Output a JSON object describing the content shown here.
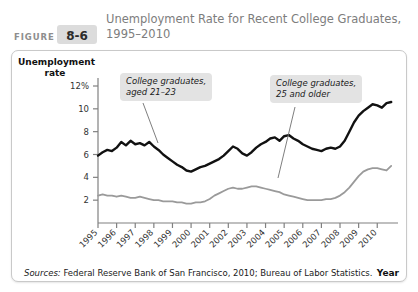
{
  "header": {
    "figure_word": "FIGURE",
    "figure_number": "8-6",
    "title": "Unemployment Rate for Recent College Graduates, 1995–2010"
  },
  "source_note": {
    "label": "Sources:",
    "text": " Federal Reserve Bank of San Francisco, 2010; Bureau of Labor Statistics."
  },
  "annotations": {
    "young": "College graduates,\naged 21–23",
    "older": "College graduates,\n25 and older"
  },
  "colors": {
    "series_young": "#111111",
    "series_older": "#9a9a9a",
    "panel_border": "#c9c9c9",
    "badge": "#dcdcdc",
    "title_text": "#7d7d7d",
    "annotation_bg": "#e3e3e3"
  },
  "chart_data": {
    "type": "line",
    "title": "Unemployment Rate for Recent College Graduates, 1995–2010",
    "xlabel": "Year",
    "ylabel": "Unemployment rate",
    "ylim": [
      0,
      12
    ],
    "yticks": [
      2,
      4,
      6,
      8,
      10,
      12
    ],
    "ytick_labels": [
      "2",
      "4",
      "6",
      "8",
      "10",
      "12%"
    ],
    "xlim": [
      1995,
      2010.9
    ],
    "xticks": [
      1995,
      1996,
      1997,
      1998,
      1999,
      2000,
      2001,
      2002,
      2003,
      2004,
      2005,
      2006,
      2007,
      2008,
      2009,
      2010
    ],
    "xtick_labels": [
      "1995",
      "1996",
      "1997",
      "1998",
      "1999",
      "2000",
      "2001",
      "2002",
      "2003",
      "2004",
      "2005",
      "2006",
      "2007",
      "2008",
      "2009",
      "2010"
    ],
    "grid": false,
    "legend": "annotations",
    "series": [
      {
        "name": "College graduates, aged 21-23",
        "color": "#111111",
        "x": [
          1995.0,
          1995.25,
          1995.5,
          1995.75,
          1996.0,
          1996.25,
          1996.5,
          1996.75,
          1997.0,
          1997.25,
          1997.5,
          1997.75,
          1998.0,
          1998.25,
          1998.5,
          1998.75,
          1999.0,
          1999.25,
          1999.5,
          1999.75,
          2000.0,
          2000.25,
          2000.5,
          2000.75,
          2001.0,
          2001.25,
          2001.5,
          2001.75,
          2002.0,
          2002.25,
          2002.5,
          2002.75,
          2003.0,
          2003.25,
          2003.5,
          2003.75,
          2004.0,
          2004.25,
          2004.5,
          2004.75,
          2005.0,
          2005.25,
          2005.5,
          2005.75,
          2006.0,
          2006.25,
          2006.5,
          2006.75,
          2007.0,
          2007.25,
          2007.5,
          2007.75,
          2008.0,
          2008.25,
          2008.5,
          2008.75,
          2009.0,
          2009.25,
          2009.5,
          2009.75,
          2010.0,
          2010.25,
          2010.5,
          2010.75
        ],
        "y": [
          5.9,
          6.2,
          6.4,
          6.3,
          6.6,
          7.1,
          6.8,
          7.2,
          6.9,
          7.0,
          6.8,
          7.1,
          6.7,
          6.4,
          6.0,
          5.7,
          5.4,
          5.1,
          4.9,
          4.6,
          4.5,
          4.7,
          4.9,
          5.0,
          5.2,
          5.4,
          5.6,
          5.9,
          6.3,
          6.7,
          6.5,
          6.1,
          5.9,
          6.2,
          6.6,
          6.9,
          7.1,
          7.4,
          7.5,
          7.2,
          7.6,
          7.7,
          7.4,
          7.2,
          6.9,
          6.7,
          6.5,
          6.4,
          6.3,
          6.5,
          6.6,
          6.5,
          6.7,
          7.2,
          8.0,
          8.8,
          9.4,
          9.8,
          10.1,
          10.4,
          10.3,
          10.1,
          10.5,
          10.6
        ]
      },
      {
        "name": "College graduates, 25 and older",
        "color": "#9a9a9a",
        "x": [
          1995.0,
          1995.25,
          1995.5,
          1995.75,
          1996.0,
          1996.25,
          1996.5,
          1996.75,
          1997.0,
          1997.25,
          1997.5,
          1997.75,
          1998.0,
          1998.25,
          1998.5,
          1998.75,
          1999.0,
          1999.25,
          1999.5,
          1999.75,
          2000.0,
          2000.25,
          2000.5,
          2000.75,
          2001.0,
          2001.25,
          2001.5,
          2001.75,
          2002.0,
          2002.25,
          2002.5,
          2002.75,
          2003.0,
          2003.25,
          2003.5,
          2003.75,
          2004.0,
          2004.25,
          2004.5,
          2004.75,
          2005.0,
          2005.25,
          2005.5,
          2005.75,
          2006.0,
          2006.25,
          2006.5,
          2006.75,
          2007.0,
          2007.25,
          2007.5,
          2007.75,
          2008.0,
          2008.25,
          2008.5,
          2008.75,
          2009.0,
          2009.25,
          2009.5,
          2009.75,
          2010.0,
          2010.25,
          2010.5,
          2010.75
        ],
        "y": [
          2.4,
          2.5,
          2.4,
          2.4,
          2.3,
          2.4,
          2.3,
          2.2,
          2.2,
          2.3,
          2.2,
          2.1,
          2.0,
          2.0,
          1.9,
          1.9,
          1.9,
          1.8,
          1.8,
          1.7,
          1.7,
          1.8,
          1.8,
          1.9,
          2.1,
          2.4,
          2.6,
          2.8,
          3.0,
          3.1,
          3.0,
          3.0,
          3.1,
          3.2,
          3.2,
          3.1,
          3.0,
          2.9,
          2.8,
          2.7,
          2.5,
          2.4,
          2.3,
          2.2,
          2.1,
          2.0,
          2.0,
          2.0,
          2.0,
          2.1,
          2.1,
          2.2,
          2.4,
          2.7,
          3.1,
          3.6,
          4.1,
          4.5,
          4.7,
          4.8,
          4.8,
          4.7,
          4.6,
          5.0
        ]
      }
    ]
  }
}
